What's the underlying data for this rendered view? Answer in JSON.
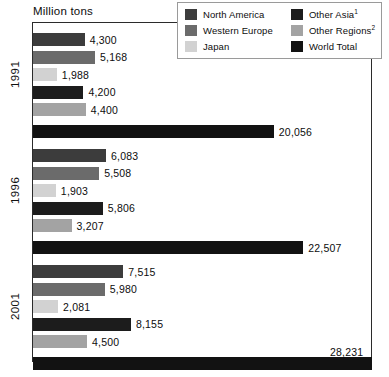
{
  "chart_data": {
    "type": "bar",
    "orientation": "horizontal",
    "title": "Million tons",
    "xlabel": "",
    "ylabel": "",
    "categories": [
      "1991",
      "1996",
      "2001"
    ],
    "xlim": [
      0,
      28231
    ],
    "grid": false,
    "legend_position": "top-right",
    "series": [
      {
        "name": "North America",
        "values": [
          4300,
          6083,
          7515
        ],
        "color": "#3c3c3c"
      },
      {
        "name": "Western Europe",
        "values": [
          5168,
          5508,
          5980
        ],
        "color": "#6b6b6b"
      },
      {
        "name": "Japan",
        "values": [
          1988,
          1903,
          2081
        ],
        "color": "#d2d2d2"
      },
      {
        "name": "Other Asia",
        "values": [
          4200,
          5806,
          8155
        ],
        "color": "#1c1c1c"
      },
      {
        "name": "Other Regions",
        "values": [
          4400,
          3207,
          4500
        ],
        "color": "#a3a3a3"
      },
      {
        "name": "World Total",
        "values": [
          20056,
          22507,
          28231
        ],
        "color": "#121212"
      }
    ],
    "value_labels": [
      "4,300",
      "5,168",
      "1,988",
      "4,200",
      "4,400",
      "20,056",
      "6,083",
      "5,508",
      "1,903",
      "5,806",
      "3,207",
      "22,507",
      "7,515",
      "5,980",
      "2,081",
      "8,155",
      "4,500",
      "28,231"
    ]
  },
  "legend": {
    "columns": [
      [
        {
          "label": "North America",
          "superscript": "",
          "swatch_name": "swatch-north-america"
        },
        {
          "label": "Western Europe",
          "superscript": "",
          "swatch_name": "swatch-western-europe"
        },
        {
          "label": "Japan",
          "superscript": "",
          "swatch_name": "swatch-japan"
        }
      ],
      [
        {
          "label": "Other Asia",
          "superscript": "1",
          "swatch_name": "swatch-other-asia"
        },
        {
          "label": "Other Regions",
          "superscript": "2",
          "swatch_name": "swatch-other-regions"
        },
        {
          "label": "World Total",
          "superscript": "",
          "swatch_name": "swatch-world-total"
        }
      ]
    ]
  },
  "axis": {
    "title": "Million tons",
    "year_labels": [
      "1991",
      "1996",
      "2001"
    ]
  },
  "colors": {
    "north_america": "#3c3c3c",
    "western_europe": "#6b6b6b",
    "japan": "#d2d2d2",
    "other_asia": "#1c1c1c",
    "other_regions": "#a3a3a3",
    "world_total": "#121212",
    "frame": "#2b2b2b",
    "legend_border": "#9a9a9a",
    "text": "#0d0d0d",
    "background": "#ffffff"
  }
}
